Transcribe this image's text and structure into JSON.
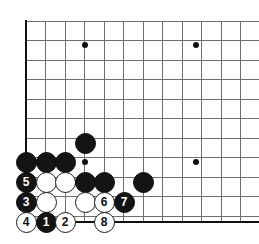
{
  "diagram": {
    "board": {
      "kind": "go-board",
      "line_color": "#6e6e6e",
      "edge_color": "#111111",
      "background_color": "#ffffff",
      "origin_x": 26,
      "origin_y": 21,
      "spacing": 19.5,
      "left_edge_x": 26,
      "bottom_edge_y": 222,
      "cols": 12,
      "rows": 11,
      "star_points": [
        {
          "x": 85,
          "y": 45
        },
        {
          "x": 196,
          "y": 45
        },
        {
          "x": 85,
          "y": 162
        },
        {
          "x": 196,
          "y": 162
        }
      ]
    },
    "stones": [
      {
        "id": "b-plain-1",
        "color": "black",
        "label": "",
        "x": 85,
        "y": 143
      },
      {
        "id": "b-plain-2",
        "color": "black",
        "label": "",
        "x": 26,
        "y": 162
      },
      {
        "id": "b-plain-3",
        "color": "black",
        "label": "",
        "x": 46,
        "y": 162
      },
      {
        "id": "b-plain-4",
        "color": "black",
        "label": "",
        "x": 65,
        "y": 162
      },
      {
        "id": "b-move-5",
        "color": "black",
        "label": "5",
        "x": 26,
        "y": 182
      },
      {
        "id": "w-plain-1",
        "color": "white",
        "label": "",
        "x": 46,
        "y": 182
      },
      {
        "id": "w-plain-2",
        "color": "white",
        "label": "",
        "x": 65,
        "y": 182
      },
      {
        "id": "b-plain-5",
        "color": "black",
        "label": "",
        "x": 85,
        "y": 182
      },
      {
        "id": "b-plain-6",
        "color": "black",
        "label": "",
        "x": 104,
        "y": 182
      },
      {
        "id": "b-plain-7",
        "color": "black",
        "label": "",
        "x": 143,
        "y": 182
      },
      {
        "id": "b-move-3",
        "color": "black",
        "label": "3",
        "x": 26,
        "y": 202
      },
      {
        "id": "w-plain-3",
        "color": "white",
        "label": "",
        "x": 46,
        "y": 202
      },
      {
        "id": "w-plain-4",
        "color": "white",
        "label": "",
        "x": 85,
        "y": 202
      },
      {
        "id": "w-move-6",
        "color": "white",
        "label": "6",
        "x": 104,
        "y": 202
      },
      {
        "id": "b-move-7",
        "color": "black",
        "label": "7",
        "x": 124,
        "y": 202
      },
      {
        "id": "w-move-4",
        "color": "white",
        "label": "4",
        "x": 26,
        "y": 222
      },
      {
        "id": "b-move-1",
        "color": "black",
        "label": "1",
        "x": 46,
        "y": 222
      },
      {
        "id": "w-move-2",
        "color": "white",
        "label": "2",
        "x": 65,
        "y": 222
      },
      {
        "id": "w-move-8",
        "color": "white",
        "label": "8",
        "x": 104,
        "y": 222
      }
    ]
  }
}
